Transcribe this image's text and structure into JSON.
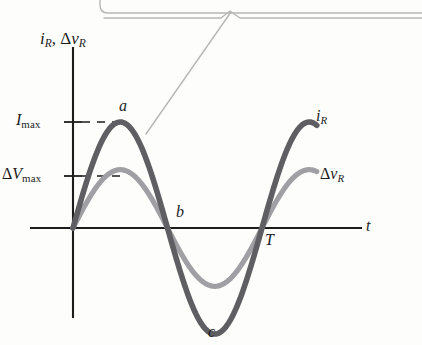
{
  "figure": {
    "kind": "physics-textbook-graph",
    "axis_label_y_parts": {
      "i": "i",
      "i_sub": "R",
      "sep": ", ",
      "delta": "Δ",
      "v": "v",
      "v_sub": "R"
    },
    "axis_label_x": "t",
    "tick_labels": {
      "i_max": {
        "symbol": "I",
        "sub": "max"
      },
      "v_max": {
        "delta": "Δ",
        "symbol": "V",
        "sub": "max"
      }
    },
    "point_labels": {
      "a": "a",
      "b": "b",
      "c": "c",
      "period": "T"
    },
    "curve_labels": {
      "current": {
        "symbol": "i",
        "sub": "R"
      },
      "voltage": {
        "delta": "Δ",
        "symbol": "v",
        "sub": "R"
      }
    },
    "colors": {
      "current_curve": "#5f5f63",
      "voltage_curve": "#a0a0a4",
      "axis": "#1c1c1c",
      "callout": "#b7b7b7",
      "text": "#1c1c1c",
      "background": "#fdfdfc"
    }
  },
  "chart_data": {
    "type": "line",
    "title": "",
    "xlabel": "t",
    "ylabel": "i_R, Δv_R",
    "grid": false,
    "legend": "inline-curve-labels",
    "xlim": [
      0,
      1.55
    ],
    "ylim": [
      -1.15,
      1.35
    ],
    "x_ticks": [
      {
        "value": 0.5,
        "label": "b"
      },
      {
        "value": 1.0,
        "label": "T"
      }
    ],
    "y_ticks": [
      {
        "value": 1.0,
        "label": "I_max"
      },
      {
        "value": 0.55,
        "label": "ΔV_max"
      }
    ],
    "annotations": [
      {
        "label": "a",
        "x": 0.25,
        "y": 1.0,
        "note": "current maximum"
      },
      {
        "label": "b",
        "x": 0.5,
        "y": 0.0,
        "note": "zero crossing, half period"
      },
      {
        "label": "c",
        "x": 0.75,
        "y": -1.0,
        "note": "current minimum"
      },
      {
        "label": "T",
        "x": 1.0,
        "y": 0.0,
        "note": "one full period"
      }
    ],
    "series": [
      {
        "name": "i_R",
        "color": "#5f5f63",
        "amplitude": 1.0,
        "period": 1.0,
        "form": "I_max*sin(2*pi*t/T)",
        "x": [
          0,
          0.0625,
          0.125,
          0.1875,
          0.25,
          0.3125,
          0.375,
          0.4375,
          0.5,
          0.5625,
          0.625,
          0.6875,
          0.75,
          0.8125,
          0.875,
          0.9375,
          1.0,
          1.0625,
          1.125,
          1.1875,
          1.25,
          1.3125
        ],
        "values": [
          0,
          0.383,
          0.707,
          0.924,
          1.0,
          0.924,
          0.707,
          0.383,
          0,
          -0.383,
          -0.707,
          -0.924,
          -1.0,
          -0.924,
          -0.707,
          -0.383,
          0,
          0.383,
          0.707,
          0.924,
          1.0,
          1.03
        ]
      },
      {
        "name": "Δv_R",
        "color": "#a0a0a4",
        "amplitude": 0.55,
        "period": 1.0,
        "form": "ΔV_max*sin(2*pi*t/T)",
        "x": [
          0,
          0.0625,
          0.125,
          0.1875,
          0.25,
          0.3125,
          0.375,
          0.4375,
          0.5,
          0.5625,
          0.625,
          0.6875,
          0.75,
          0.8125,
          0.875,
          0.9375,
          1.0,
          1.0625,
          1.125,
          1.1875,
          1.25,
          1.3125
        ],
        "values": [
          0,
          0.211,
          0.389,
          0.508,
          0.55,
          0.508,
          0.389,
          0.211,
          0,
          -0.211,
          -0.389,
          -0.508,
          -0.55,
          -0.508,
          -0.389,
          -0.211,
          0,
          0.211,
          0.389,
          0.508,
          0.55,
          0.566
        ]
      }
    ]
  },
  "callout": {
    "present": true,
    "description": "leader line from bubble above pointing to the current curve",
    "text": ""
  },
  "bleed_text": {
    "line1": "",
    "line2": ""
  }
}
